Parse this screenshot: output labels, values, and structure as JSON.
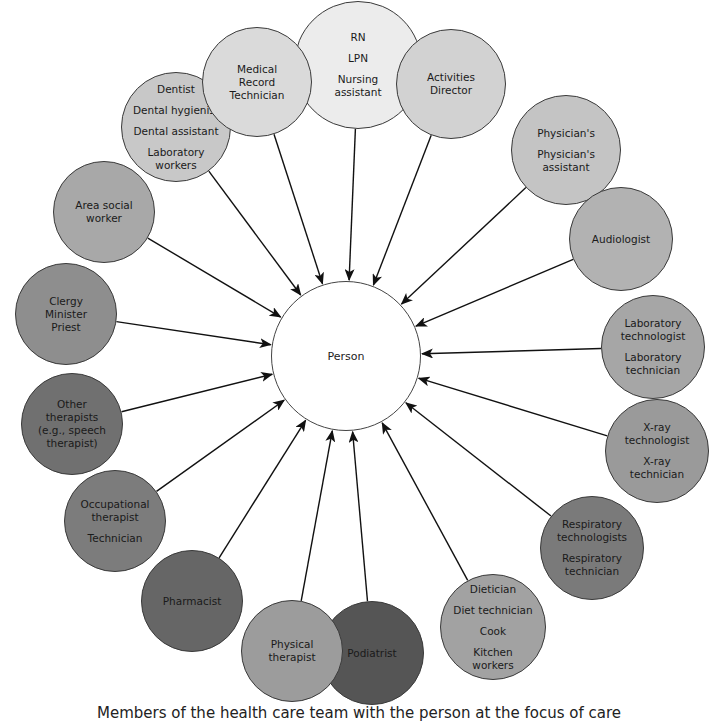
{
  "diagram": {
    "center": {
      "label": "Person",
      "x": 346,
      "y": 356,
      "r": 75
    },
    "nodes": [
      {
        "id": "nursing",
        "x": 358,
        "y": 65,
        "r": 64,
        "fill": "#ececec",
        "groups": [
          [
            "RN"
          ],
          [
            "LPN"
          ],
          [
            "Nursing",
            "assistant"
          ]
        ]
      },
      {
        "id": "activities-director",
        "x": 451,
        "y": 84,
        "r": 55,
        "fill": "#d2d2d2",
        "groups": [
          [
            "Activities",
            "Director"
          ]
        ]
      },
      {
        "id": "physician",
        "x": 566,
        "y": 150,
        "r": 55,
        "fill": "#c4c4c4",
        "groups": [
          [
            "Physician's"
          ],
          [
            "Physician's",
            "assistant"
          ]
        ]
      },
      {
        "id": "audiologist",
        "x": 621,
        "y": 239,
        "r": 52,
        "fill": "#b2b2b2",
        "groups": [
          [
            "Audiologist"
          ]
        ]
      },
      {
        "id": "laboratory",
        "x": 653,
        "y": 347,
        "r": 52,
        "fill": "#a6a6a6",
        "groups": [
          [
            "Laboratory",
            "technologist"
          ],
          [
            "Laboratory",
            "technician"
          ]
        ]
      },
      {
        "id": "x-ray",
        "x": 657,
        "y": 451,
        "r": 52,
        "fill": "#9a9a9a",
        "groups": [
          [
            "X-ray",
            "technologist"
          ],
          [
            "X-ray",
            "technician"
          ]
        ]
      },
      {
        "id": "respiratory",
        "x": 592,
        "y": 548,
        "r": 52,
        "fill": "#7a7a7a",
        "groups": [
          [
            "Respiratory",
            "technologists"
          ],
          [
            "Respiratory",
            "technician"
          ]
        ]
      },
      {
        "id": "dietary",
        "x": 493,
        "y": 627,
        "r": 53,
        "fill": "#a2a2a2",
        "groups": [
          [
            "Dietician"
          ],
          [
            "Diet technician"
          ],
          [
            "Cook"
          ],
          [
            "Kitchen",
            "workers"
          ]
        ]
      },
      {
        "id": "podiatrist",
        "x": 372,
        "y": 653,
        "r": 52,
        "fill": "#555555",
        "groups": [
          [
            "Podiatrist"
          ]
        ]
      },
      {
        "id": "physical-therapist",
        "x": 292,
        "y": 651,
        "r": 51,
        "fill": "#9c9c9c",
        "groups": [
          [
            "Physical",
            "therapist"
          ]
        ]
      },
      {
        "id": "pharmacist",
        "x": 192,
        "y": 601,
        "r": 51,
        "fill": "#666666",
        "groups": [
          [
            "Pharmacist"
          ]
        ]
      },
      {
        "id": "occupational-therapist",
        "x": 115,
        "y": 521,
        "r": 51,
        "fill": "#7c7c7c",
        "groups": [
          [
            "Occupational",
            "therapist"
          ],
          [
            "Technician"
          ]
        ]
      },
      {
        "id": "other-therapists",
        "x": 72,
        "y": 424,
        "r": 51,
        "fill": "#707070",
        "groups": [
          [
            "Other",
            "therapists",
            "(e.g., speech",
            "therapist)"
          ]
        ]
      },
      {
        "id": "clergy",
        "x": 66,
        "y": 314,
        "r": 51,
        "fill": "#8e8e8e",
        "groups": [
          [
            "Clergy",
            "Minister",
            "Priest"
          ]
        ]
      },
      {
        "id": "area-social-worker",
        "x": 104,
        "y": 212,
        "r": 51,
        "fill": "#a8a8a8",
        "groups": [
          [
            "Area social",
            "worker"
          ]
        ]
      },
      {
        "id": "dental",
        "x": 176,
        "y": 127,
        "r": 55,
        "fill": "#c8c8c8",
        "groups": [
          [
            "Dentist"
          ],
          [
            "Dental hygienist"
          ],
          [
            "Dental assistant"
          ],
          [
            "Laboratory",
            "workers"
          ]
        ]
      },
      {
        "id": "medical-record-technician",
        "x": 257,
        "y": 82,
        "r": 55,
        "fill": "#dadada",
        "groups": [
          [
            "Medical",
            "Record",
            "Technician"
          ]
        ]
      }
    ],
    "arrow_color": "#111111"
  },
  "caption": "Members of the health care team with the person at the focus of care"
}
